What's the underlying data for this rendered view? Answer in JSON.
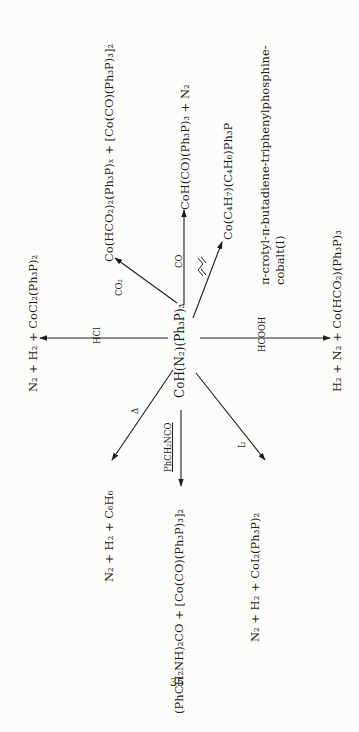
{
  "page": {
    "number": "35",
    "orientation": "rotated 90 degrees counter-clockwise"
  },
  "diagram": {
    "center_compound": "CoH(N₂)(Ph₃P)₃",
    "reactions": [
      {
        "reagent": "HCl",
        "products": "N₂  +  H₂  +  CoCl₂(Ph₃P)₂"
      },
      {
        "reagent": "CO₂",
        "products": "Co(HCO₂)₂(Ph₃P)ₓ  +  [Co(CO)(Ph₃P)₃]₂"
      },
      {
        "reagent": "CO",
        "products": "CoH(CO)(Ph₃P)₃  +  N₂"
      },
      {
        "reagent": "butadiene",
        "products": "Co(C₄H₇)(C₄H₆)Ph₃P"
      },
      {
        "reagent": "HCOOH",
        "products": "H₂  +  N₂  +  Co(HCO₂)(Ph₃P)₃"
      },
      {
        "reagent": "Δ",
        "products": "N₂  +  H₂  +  C₆H₆"
      },
      {
        "reagent": "PhCH₂NCO",
        "products": "(PhCH₂NH)₂CO  +  [Co(CO)(Ph₃P)₃]₂"
      },
      {
        "reagent": "I₂",
        "products": "N₂  +  H₂  +  CoI₂(Ph₃P)₂"
      }
    ],
    "annotation": {
      "line1": "π-crotyl-π-butadiene-triphenylphosphine-",
      "line2": "cobalt(I)"
    }
  }
}
